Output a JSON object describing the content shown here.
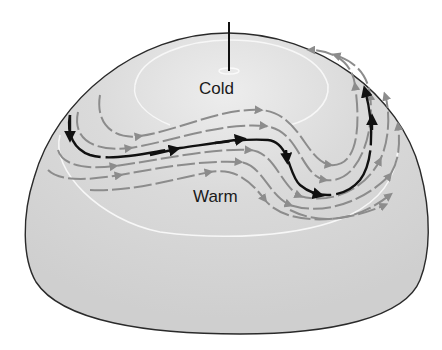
{
  "diagram": {
    "labels": {
      "cold": "Cold",
      "warm": "Warm"
    },
    "caption": "",
    "colors": {
      "background": "#ffffff",
      "dome_fill": "#d4d4d4",
      "dome_top_fill": "#e8e8e8",
      "outline": "#2a2a2a",
      "isotherm": "#f7f7f7",
      "primary_flow": "#111111",
      "secondary_flow": "#8c8c8c"
    },
    "elements": [
      {
        "name": "hemisphere",
        "type": "dome"
      },
      {
        "name": "rotation-axis",
        "type": "line"
      },
      {
        "name": "pole-ring",
        "type": "ellipse"
      },
      {
        "name": "cold-isotherm",
        "type": "white-curve"
      },
      {
        "name": "warm-isotherm",
        "type": "white-curve"
      },
      {
        "name": "jet-stream",
        "type": "black-arrowed-path"
      },
      {
        "name": "flow-lines",
        "type": "gray-dashed-arrowed-paths",
        "count": 6
      }
    ]
  }
}
